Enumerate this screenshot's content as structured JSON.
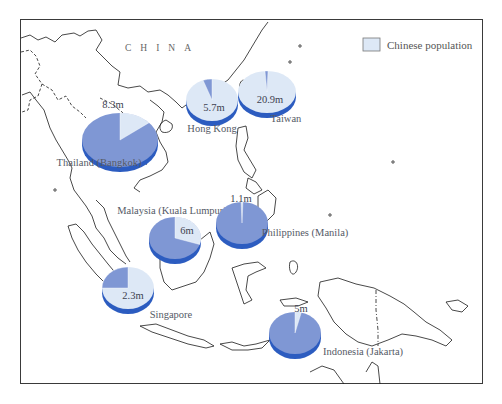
{
  "map": {
    "country_label": "CHINA",
    "legend": {
      "label": "Chinese population",
      "swatch_color": "#dde8f6"
    },
    "colors": {
      "chinese": "#dde8f6",
      "other": "#7f97d4",
      "rim": "#2c5cc0",
      "coast": "#1a1a1a"
    }
  },
  "chart_data": {
    "type": "pie",
    "title": "",
    "legend": [
      "Chinese population"
    ],
    "legend_position": "top-right",
    "series": [
      {
        "name": "Thailand (Bangkok)",
        "value_label": "8.3m",
        "chinese_population_millions": 8.3,
        "chinese_share": 0.14
      },
      {
        "name": "Hong Kong",
        "value_label": "5.7m",
        "chinese_population_millions": 5.7,
        "chinese_share": 0.95
      },
      {
        "name": "Taiwan",
        "value_label": "20.9m",
        "chinese_population_millions": 20.9,
        "chinese_share": 0.98
      },
      {
        "name": "Malaysia (Kuala Lumpur)",
        "value_label": "6m",
        "chinese_population_millions": 6.0,
        "chinese_share": 0.3
      },
      {
        "name": "Philippines (Manila)",
        "value_label": "1.1m",
        "chinese_population_millions": 1.1,
        "chinese_share": 0.015
      },
      {
        "name": "Singapore",
        "value_label": "2.3m",
        "chinese_population_millions": 2.3,
        "chinese_share": 0.76
      },
      {
        "name": "Indonesia (Jakarta)",
        "value_label": "5m",
        "chinese_population_millions": 5.0,
        "chinese_share": 0.035
      }
    ]
  },
  "pies": [
    {
      "id": "thailand",
      "cx": 120,
      "cy": 140,
      "rx": 38,
      "ry": 27,
      "start_deg": 0,
      "sweep_deg": 50,
      "light_is_slice": true,
      "value": "8.3m",
      "value_x": 113,
      "value_y": 108,
      "name": "Thailand (Bangkok)",
      "name_x": 99,
      "name_y": 166
    },
    {
      "id": "hong-kong",
      "cx": 212,
      "cy": 100,
      "rx": 26,
      "ry": 21,
      "start_deg": -20,
      "sweep_deg": 20,
      "light_is_slice": false,
      "value": "5.7m",
      "value_x": 214,
      "value_y": 111,
      "name": "Hong Kong",
      "name_x": 212,
      "name_y": 132
    },
    {
      "id": "taiwan",
      "cx": 267,
      "cy": 92,
      "rx": 29,
      "ry": 21,
      "start_deg": -4,
      "sweep_deg": 6,
      "light_is_slice": false,
      "value": "20.9m",
      "value_x": 270,
      "value_y": 103,
      "name": "Taiwan",
      "name_x": 286,
      "name_y": 122
    },
    {
      "id": "malaysia",
      "cx": 175,
      "cy": 238,
      "rx": 26,
      "ry": 21,
      "start_deg": 0,
      "sweep_deg": 108,
      "light_is_slice": true,
      "value": "6m",
      "value_x": 187,
      "value_y": 234,
      "name": "Malaysia (Kuala Lumpur)",
      "name_x": 172,
      "name_y": 214
    },
    {
      "id": "philippines",
      "cx": 242,
      "cy": 223,
      "rx": 26,
      "ry": 21,
      "start_deg": -2,
      "sweep_deg": 4,
      "light_is_slice": true,
      "value": "1.1m",
      "value_x": 241,
      "value_y": 202,
      "name": "Philippines (Manila)",
      "name_x": 305,
      "name_y": 236
    },
    {
      "id": "singapore",
      "cx": 128,
      "cy": 288,
      "rx": 26,
      "ry": 21,
      "start_deg": -90,
      "sweep_deg": 90,
      "light_is_slice": false,
      "value": "2.3m",
      "value_x": 133,
      "value_y": 299,
      "name": "Singapore",
      "name_x": 171,
      "name_y": 318
    },
    {
      "id": "indonesia",
      "cx": 295,
      "cy": 333,
      "rx": 26,
      "ry": 21,
      "start_deg": 0,
      "sweep_deg": 14,
      "light_is_slice": true,
      "value": "5m",
      "value_x": 301,
      "value_y": 312,
      "name": "Indonesia (Jakarta)",
      "name_x": 363,
      "name_y": 355
    }
  ]
}
